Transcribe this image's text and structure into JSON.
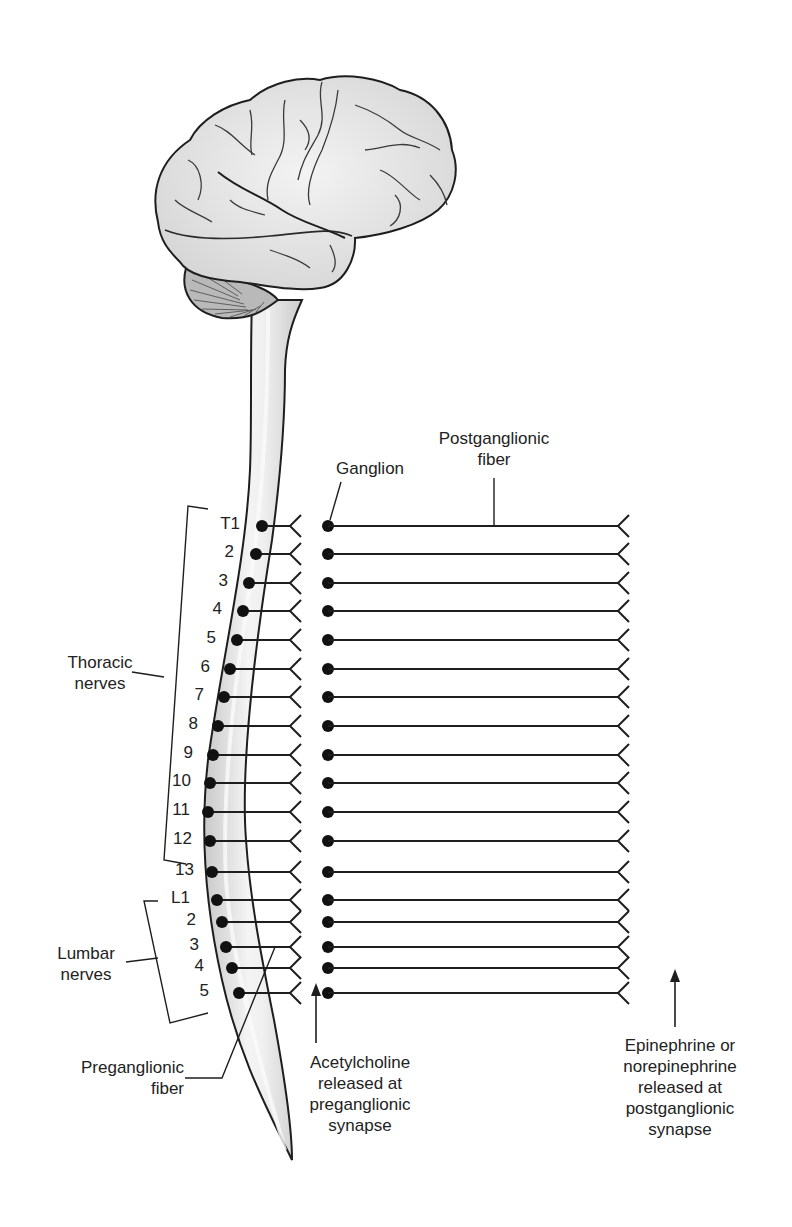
{
  "diagram": {
    "colors": {
      "line": "#1e1e1e",
      "brain_fill": "#e2e2e2",
      "brain_highlight": "#f2f2f2",
      "cerebellum_fill": "#b9b9b9",
      "cord_fill": "#d3d3d3",
      "cord_highlight": "#f4f4f4",
      "background": "#ffffff"
    },
    "labels": {
      "postganglionic": {
        "line1": "Postganglionic",
        "line2": "fiber"
      },
      "ganglion": "Ganglion",
      "thoracic": {
        "line1": "Thoracic",
        "line2": "nerves"
      },
      "lumbar": {
        "line1": "Lumbar",
        "line2": "nerves"
      },
      "preganglionic": {
        "line1": "Preganglionic",
        "line2": "fiber"
      },
      "acetylcholine": {
        "line1": "Acetylcholine",
        "line2": "released at",
        "line3": "preganglionic",
        "line4": "synapse"
      },
      "epinephrine": {
        "line1": "Epinephrine or",
        "line2": "norepinephrine",
        "line3": "released at",
        "line4": "postganglionic",
        "line5": "synapse"
      }
    },
    "segments": [
      {
        "group": "thoracic",
        "label": "T1",
        "y": 526,
        "cordX": 262,
        "labelX": 240
      },
      {
        "group": "thoracic",
        "label": "2",
        "y": 554,
        "cordX": 256,
        "labelX": 234
      },
      {
        "group": "thoracic",
        "label": "3",
        "y": 583,
        "cordX": 249,
        "labelX": 228
      },
      {
        "group": "thoracic",
        "label": "4",
        "y": 611,
        "cordX": 243,
        "labelX": 222
      },
      {
        "group": "thoracic",
        "label": "5",
        "y": 640,
        "cordX": 237,
        "labelX": 216
      },
      {
        "group": "thoracic",
        "label": "6",
        "y": 669,
        "cordX": 230,
        "labelX": 210
      },
      {
        "group": "thoracic",
        "label": "7",
        "y": 697,
        "cordX": 224,
        "labelX": 204
      },
      {
        "group": "thoracic",
        "label": "8",
        "y": 726,
        "cordX": 218,
        "labelX": 198
      },
      {
        "group": "thoracic",
        "label": "9",
        "y": 755,
        "cordX": 213,
        "labelX": 193
      },
      {
        "group": "thoracic",
        "label": "10",
        "y": 783,
        "cordX": 210,
        "labelX": 191
      },
      {
        "group": "thoracic",
        "label": "11",
        "y": 812,
        "cordX": 208,
        "labelX": 190
      },
      {
        "group": "thoracic",
        "label": "12",
        "y": 841,
        "cordX": 210,
        "labelX": 192
      },
      {
        "group": "thoracic",
        "label": "13",
        "y": 872,
        "cordX": 212,
        "labelX": 194
      },
      {
        "group": "lumbar",
        "label": "L1",
        "y": 900,
        "cordX": 217,
        "labelX": 190
      },
      {
        "group": "lumbar",
        "label": "2",
        "y": 922,
        "cordX": 222,
        "labelX": 196
      },
      {
        "group": "lumbar",
        "label": "3",
        "y": 947,
        "cordX": 226,
        "labelX": 199
      },
      {
        "group": "lumbar",
        "label": "4",
        "y": 968,
        "cordX": 232,
        "labelX": 204
      },
      {
        "group": "lumbar",
        "label": "5",
        "y": 993,
        "cordX": 239,
        "labelX": 209
      }
    ],
    "geometry": {
      "synapse_x": 290,
      "ganglion_x": 328,
      "post_end_x": 618
    }
  }
}
